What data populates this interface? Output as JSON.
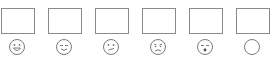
{
  "rating_scale": {
    "items": [
      {
        "id": "very-happy",
        "face_icon": "grinning-face-icon",
        "box_value": ""
      },
      {
        "id": "content",
        "face_icon": "relieved-face-icon",
        "box_value": ""
      },
      {
        "id": "neutral",
        "face_icon": "confused-face-icon",
        "box_value": ""
      },
      {
        "id": "sad",
        "face_icon": "sad-face-icon",
        "box_value": ""
      },
      {
        "id": "shocked",
        "face_icon": "surprised-face-icon",
        "box_value": ""
      },
      {
        "id": "blank",
        "face_icon": "blank-circle-icon",
        "box_value": ""
      }
    ],
    "stroke_color": "#7a7a7a"
  }
}
